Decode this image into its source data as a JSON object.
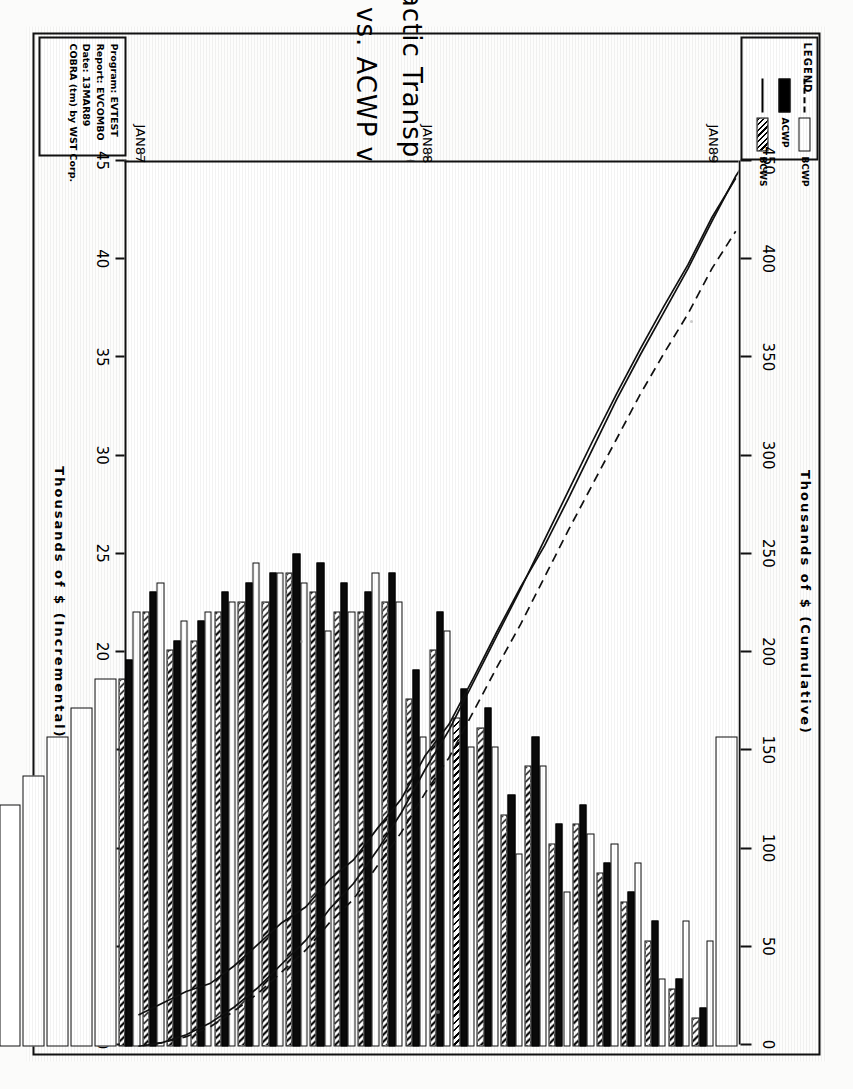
{
  "report": {
    "program_label": "Program:",
    "program_value": "EVTEST",
    "report_label": "Report:",
    "report_value": "EVCOMBO",
    "date_label": "Date:",
    "date_value": "13MAR89",
    "footer": "COBRA (tm) by WST Corp."
  },
  "legend": {
    "title": "LEGEND",
    "entries": [
      {
        "key": "BCWP",
        "label": "BCWP",
        "style": "dashed-line-and-hollow-bar"
      },
      {
        "key": "ACWP",
        "label": "ACWP",
        "style": "solid-black-bar"
      },
      {
        "key": "BCWS",
        "label": "BCWS",
        "style": "solid-line-and-crosshatch-bar"
      }
    ]
  },
  "chart_data": {
    "type": "bar",
    "title": "Intergalactic Transport System",
    "subtitle": "BCWS vs. ACWP vs. BCWP",
    "xlabel": "",
    "ylabel": "Thousands of $ (Incremental)",
    "y2label": "Thousands of $ (Cumulative)",
    "ylim": [
      0,
      45
    ],
    "y2lim": [
      0,
      450
    ],
    "yticks": [
      0,
      5,
      10,
      15,
      20,
      25,
      30,
      35,
      40,
      45
    ],
    "y2ticks": [
      0,
      50,
      100,
      150,
      200,
      250,
      300,
      350,
      400,
      450
    ],
    "grid": false,
    "legend_position": "top-left",
    "orientation": "vertical-bars-rotated-90ccw-in-scan",
    "categories": [
      "JAN87",
      "FEB87",
      "MAR87",
      "APR87",
      "MAY87",
      "JUN87",
      "JUL87",
      "AUG87",
      "SEP87",
      "OCT87",
      "NOV87",
      "DEC87",
      "JAN88",
      "FEB88",
      "MAR88",
      "APR88",
      "MAY88",
      "JUN88",
      "JUL88",
      "AUG88",
      "SEP88",
      "OCT88",
      "NOV88",
      "DEC88",
      "JAN89",
      "FEB89",
      "MAR89",
      "APR89",
      "MAY89",
      "JUN89",
      "JUL89",
      "AUG89",
      "SEP89",
      "OCT89",
      "NOV89",
      "DEC89",
      "JAN90"
    ],
    "tick_categories": [
      "JAN87",
      "JAN88",
      "JAN89",
      "JAN90"
    ],
    "series": [
      {
        "name": "BCWS",
        "kind": "bar",
        "pattern": "hollow",
        "values": [
          16.0,
          5.5,
          6.5,
          3.5,
          9.5,
          10.5,
          11.0,
          8.0,
          14.5,
          10.0,
          15.5,
          15.5,
          21.5,
          16.0,
          23.0,
          24.5,
          22.5,
          21.5,
          24.0,
          24.5,
          25.0,
          23.0,
          22.5,
          22.0,
          24.0,
          22.5,
          19.0,
          17.5,
          16.0,
          14.0,
          12.5,
          11.0,
          4.5,
          3.0,
          5.5,
          8.5,
          9.5
        ]
      },
      {
        "name": "ACWP",
        "kind": "bar",
        "pattern": "solid-black",
        "values": [
          0.0,
          2.0,
          3.5,
          6.5,
          8.0,
          9.5,
          12.5,
          11.5,
          16.0,
          13.0,
          17.5,
          18.5,
          22.5,
          19.5,
          24.5,
          23.5,
          24.0,
          25.0,
          25.5,
          24.5,
          24.0,
          23.5,
          22.0,
          21.0,
          23.5,
          20.0,
          0.0,
          0.0,
          0.0,
          0.0,
          0.0,
          0.0,
          0.0,
          0.0,
          0.0,
          0.0,
          0.0
        ]
      },
      {
        "name": "BCWP",
        "kind": "bar",
        "pattern": "crosshatch",
        "values": [
          0.0,
          1.5,
          3.0,
          5.5,
          7.5,
          9.0,
          11.5,
          10.5,
          14.5,
          12.0,
          16.5,
          17.0,
          20.5,
          18.0,
          23.0,
          22.5,
          22.5,
          23.5,
          24.5,
          23.0,
          23.0,
          22.5,
          21.0,
          20.5,
          22.5,
          19.0,
          0.0,
          0.0,
          0.0,
          0.0,
          0.0,
          0.0,
          0.0,
          0.0,
          0.0,
          0.0,
          0.0
        ]
      },
      {
        "name": "BCWS cumulative",
        "kind": "line",
        "style": "solid",
        "axis": "cumulative",
        "values": [
          16,
          22,
          28,
          32,
          41,
          52,
          63,
          71,
          85,
          95,
          111,
          126,
          148,
          164,
          187,
          211,
          234,
          255,
          279,
          304,
          329,
          352,
          374,
          396,
          420,
          443,
          462,
          479,
          495,
          509,
          522,
          533,
          537,
          540,
          546,
          554,
          564
        ]
      },
      {
        "name": "ACWP cumulative",
        "kind": "line",
        "style": "solid",
        "axis": "cumulative",
        "values": [
          0,
          2,
          6,
          12,
          20,
          30,
          42,
          54,
          70,
          83,
          100,
          119,
          141,
          161,
          185,
          209,
          233,
          258,
          283,
          308,
          332,
          355,
          377,
          398,
          422,
          442,
          null,
          null,
          null,
          null,
          null,
          null,
          null,
          null,
          null,
          null,
          null
        ]
      },
      {
        "name": "BCWP cumulative",
        "kind": "line",
        "style": "dashed",
        "axis": "cumulative",
        "values": [
          0,
          2,
          5,
          10,
          18,
          27,
          38,
          49,
          63,
          75,
          92,
          109,
          129,
          147,
          170,
          193,
          215,
          239,
          263,
          286,
          309,
          332,
          353,
          373,
          396,
          415,
          null,
          null,
          null,
          null,
          null,
          null,
          null,
          null,
          null,
          null,
          null
        ]
      }
    ]
  }
}
